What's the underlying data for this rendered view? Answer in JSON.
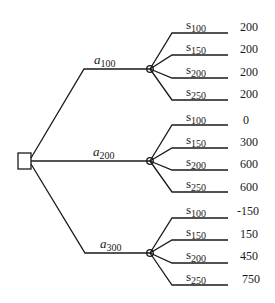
{
  "diagram": {
    "type": "decision-tree",
    "root": {
      "shape": "square",
      "kind": "decision-node"
    },
    "actions": [
      {
        "label": "a",
        "subscript": "100",
        "outcomes": [
          {
            "state": "s",
            "subscript": "100",
            "payoff": "200"
          },
          {
            "state": "s",
            "subscript": "150",
            "payoff": "200"
          },
          {
            "state": "s",
            "subscript": "200",
            "payoff": "200"
          },
          {
            "state": "s",
            "subscript": "250",
            "payoff": "200"
          }
        ]
      },
      {
        "label": "a",
        "subscript": "200",
        "outcomes": [
          {
            "state": "s",
            "subscript": "100",
            "payoff": "0"
          },
          {
            "state": "s",
            "subscript": "150",
            "payoff": "300"
          },
          {
            "state": "s",
            "subscript": "200",
            "payoff": "600"
          },
          {
            "state": "s",
            "subscript": "250",
            "payoff": "600"
          }
        ]
      },
      {
        "label": "a",
        "subscript": "300",
        "outcomes": [
          {
            "state": "s",
            "subscript": "100",
            "payoff": "-150"
          },
          {
            "state": "s",
            "subscript": "150",
            "payoff": "150"
          },
          {
            "state": "s",
            "subscript": "200",
            "payoff": "450"
          },
          {
            "state": "s",
            "subscript": "250",
            "payoff": "750"
          }
        ]
      }
    ]
  }
}
